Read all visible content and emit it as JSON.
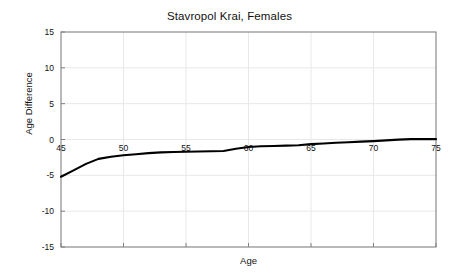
{
  "chart_data": {
    "type": "line",
    "title": "Stavropol Krai, Females",
    "xlabel": "Age",
    "ylabel": "Age Difference",
    "xlim": [
      45,
      75
    ],
    "ylim": [
      -15,
      15
    ],
    "xticks": [
      45,
      50,
      55,
      60,
      65,
      70,
      75
    ],
    "xtick_labels": [
      "45",
      "50",
      "55",
      "60",
      "65",
      "70",
      "75"
    ],
    "yticks": [
      15,
      10,
      5,
      0,
      -5,
      -10,
      -15
    ],
    "ytick_labels": [
      "15",
      "10",
      "5",
      "0",
      "-5",
      "-10",
      "-15"
    ],
    "grid": true,
    "legend": null,
    "line_color": "#000000",
    "grid_color": "#e8e8e8",
    "axis_color": "#808080",
    "series": [
      {
        "name": "Age Difference",
        "x": [
          45,
          46,
          47,
          48,
          49,
          50,
          51,
          52,
          53,
          54,
          55,
          56,
          57,
          58,
          59,
          60,
          61,
          62,
          63,
          64,
          65,
          66,
          67,
          68,
          69,
          70,
          71,
          72,
          73,
          74,
          75
        ],
        "values": [
          -5.2,
          -4.3,
          -3.4,
          -2.7,
          -2.4,
          -2.2,
          -2.05,
          -1.9,
          -1.8,
          -1.75,
          -1.7,
          -1.68,
          -1.65,
          -1.6,
          -1.3,
          -1.05,
          -0.95,
          -0.9,
          -0.85,
          -0.8,
          -0.65,
          -0.55,
          -0.45,
          -0.38,
          -0.3,
          -0.22,
          -0.12,
          -0.02,
          0.05,
          0.08,
          0.05
        ]
      }
    ]
  },
  "axis_label_x": "Age",
  "axis_label_y": "Age Difference"
}
